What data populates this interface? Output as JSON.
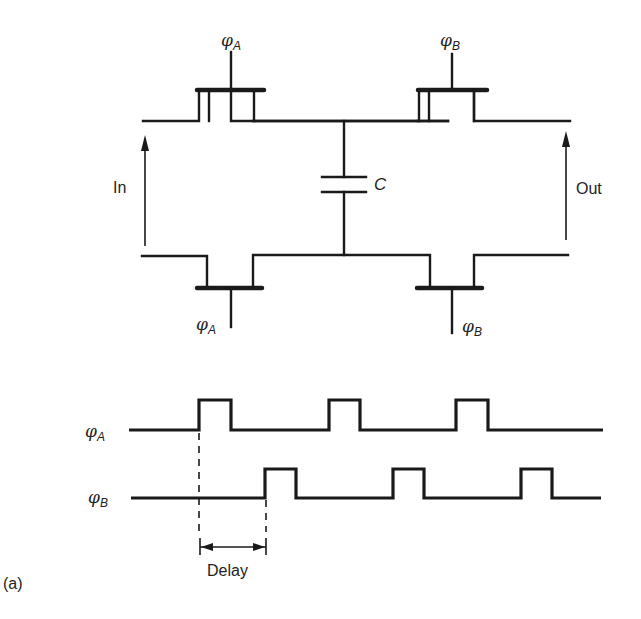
{
  "figure": {
    "label": "(a)",
    "circuit": {
      "transistors": [
        {
          "id": "top-left",
          "clock_symbol": "φ",
          "clock_sub": "A"
        },
        {
          "id": "top-right",
          "clock_symbol": "φ",
          "clock_sub": "B"
        },
        {
          "id": "bottom-left",
          "clock_symbol": "φ",
          "clock_sub": "A"
        },
        {
          "id": "bottom-right",
          "clock_symbol": "φ",
          "clock_sub": "B"
        }
      ],
      "capacitor_label": "C",
      "input_label": "In",
      "output_label": "Out"
    },
    "timing": {
      "signals": [
        {
          "symbol": "φ",
          "sub": "A",
          "pulses_x": [
            [
              200,
              232
            ],
            [
              329,
              361
            ],
            [
              456,
              488
            ]
          ]
        },
        {
          "symbol": "φ",
          "sub": "B",
          "pulses_x": [
            [
              265,
              297
            ],
            [
              392,
              424
            ],
            [
              521,
              553
            ]
          ]
        }
      ],
      "delay_label": "Delay"
    }
  }
}
